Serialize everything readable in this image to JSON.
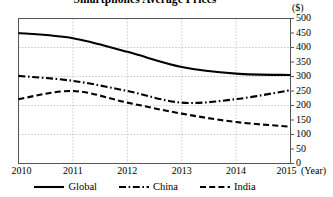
{
  "chart_data": {
    "type": "line",
    "title": "Smartphones Average Prices",
    "xlabel": "(Year)",
    "ylabel": "($)",
    "yunit": "($)",
    "grid": true,
    "legend_position": "bottom",
    "categories": [
      "2010",
      "2011",
      "2012",
      "2013",
      "2014",
      "2015"
    ],
    "x": [
      2010,
      2011,
      2012,
      2013,
      2014,
      2015
    ],
    "xlim": [
      2010,
      2015
    ],
    "ylim": [
      0,
      500
    ],
    "ytick_values": [
      0,
      50,
      100,
      150,
      200,
      250,
      300,
      350,
      400,
      450,
      500
    ],
    "ytick_labels": [
      "0",
      "50",
      "100",
      "150",
      "200",
      "250",
      "300",
      "350",
      "400",
      "450",
      "500"
    ],
    "xtick_labels": [
      "2010",
      "2011",
      "2012",
      "2013",
      "2014",
      "2015"
    ],
    "gridline_values": [
      100,
      200,
      300,
      400
    ],
    "series": [
      {
        "name": "Global",
        "style": "solid",
        "color": "#000000",
        "values": [
          450,
          432,
          385,
          333,
          310,
          305
        ]
      },
      {
        "name": "China",
        "style": "dash-dot",
        "color": "#000000",
        "values": [
          302,
          285,
          250,
          210,
          222,
          253
        ]
      },
      {
        "name": "India",
        "style": "dashed",
        "color": "#000000",
        "values": [
          222,
          250,
          210,
          172,
          143,
          127
        ]
      }
    ]
  },
  "legend": {
    "items": [
      {
        "label": "Global",
        "style": "solid"
      },
      {
        "label": "China",
        "style": "dash-dot"
      },
      {
        "label": "India",
        "style": "dashed"
      }
    ]
  },
  "axes": {
    "y_unit_label": "($)",
    "x_unit_label": "(Year)"
  },
  "colors": {
    "line": "#000000",
    "grid": "#bdbdbd",
    "axis": "#555555",
    "background": "#ffffff"
  }
}
